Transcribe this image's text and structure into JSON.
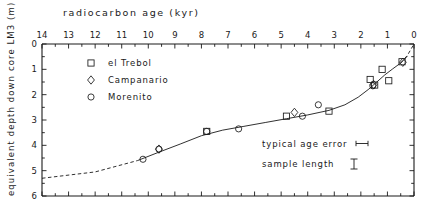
{
  "chart_data": {
    "type": "scatter",
    "title": "radiocarbon age  (kyr)",
    "xlabel": "radiocarbon age  (kyr)",
    "ylabel": "equivalent depth down core LM3  (m)",
    "xlim": [
      14,
      0
    ],
    "ylim": [
      6,
      0
    ],
    "x_axis_position": "top",
    "y_axis_inverted": true,
    "grid": false,
    "legend_position": "top-left",
    "xticks": [
      14,
      13,
      12,
      11,
      10,
      9,
      8,
      7,
      6,
      5,
      4,
      3,
      2,
      1,
      0
    ],
    "xtick_labels": [
      "14",
      "13",
      "12",
      "11",
      "10",
      "9",
      "8",
      "7",
      "6",
      "5",
      "4",
      "3",
      "2",
      "1",
      "0"
    ],
    "xminor_step": 0.5,
    "yticks": [
      0,
      1,
      2,
      3,
      4,
      5,
      6
    ],
    "ytick_labels": [
      "0",
      "1",
      "2",
      "3",
      "4",
      "5",
      "6"
    ],
    "series": [
      {
        "name": "el Trebol",
        "marker": "square",
        "points": [
          {
            "x": 7.8,
            "y": 3.45
          },
          {
            "x": 4.8,
            "y": 2.85
          },
          {
            "x": 3.2,
            "y": 2.65
          },
          {
            "x": 1.65,
            "y": 1.4
          },
          {
            "x": 1.48,
            "y": 1.62
          },
          {
            "x": 1.2,
            "y": 1.0
          },
          {
            "x": 0.95,
            "y": 1.45
          },
          {
            "x": 0.45,
            "y": 0.7
          }
        ]
      },
      {
        "name": "Campanario",
        "marker": "diamond",
        "points": [
          {
            "x": 9.6,
            "y": 4.15
          },
          {
            "x": 4.5,
            "y": 2.7
          },
          {
            "x": 1.52,
            "y": 1.6
          },
          {
            "x": 0.42,
            "y": 0.72
          }
        ]
      },
      {
        "name": "Morenito",
        "marker": "circle",
        "points": [
          {
            "x": 10.2,
            "y": 4.55
          },
          {
            "x": 9.6,
            "y": 4.15
          },
          {
            "x": 7.8,
            "y": 3.45
          },
          {
            "x": 6.6,
            "y": 3.35
          },
          {
            "x": 4.2,
            "y": 2.85
          },
          {
            "x": 3.6,
            "y": 2.4
          },
          {
            "x": 1.55,
            "y": 1.65
          }
        ]
      }
    ],
    "fit_curve": {
      "name": "age-depth model",
      "style": "solid",
      "points": [
        {
          "x": 10.4,
          "y": 4.6
        },
        {
          "x": 9.6,
          "y": 4.27
        },
        {
          "x": 8.8,
          "y": 3.95
        },
        {
          "x": 8.0,
          "y": 3.62
        },
        {
          "x": 7.2,
          "y": 3.4
        },
        {
          "x": 6.4,
          "y": 3.25
        },
        {
          "x": 5.6,
          "y": 3.1
        },
        {
          "x": 4.8,
          "y": 2.95
        },
        {
          "x": 4.0,
          "y": 2.8
        },
        {
          "x": 3.2,
          "y": 2.62
        },
        {
          "x": 2.6,
          "y": 2.4
        },
        {
          "x": 2.1,
          "y": 2.1
        },
        {
          "x": 1.7,
          "y": 1.78
        },
        {
          "x": 1.4,
          "y": 1.5
        },
        {
          "x": 1.1,
          "y": 1.22
        },
        {
          "x": 0.8,
          "y": 0.98
        },
        {
          "x": 0.5,
          "y": 0.75
        },
        {
          "x": 0.25,
          "y": 0.48
        }
      ]
    },
    "extrapolation_left": {
      "style": "dashed",
      "points": [
        {
          "x": 14.0,
          "y": 5.3
        },
        {
          "x": 12.0,
          "y": 5.05
        },
        {
          "x": 10.4,
          "y": 4.6
        }
      ]
    },
    "extrapolation_right": {
      "style": "dashed",
      "points": [
        {
          "x": 0.5,
          "y": 0.75
        },
        {
          "x": 0.25,
          "y": 0.45
        },
        {
          "x": 0.0,
          "y": 0.0
        }
      ]
    },
    "annotations": [
      {
        "label": "typical age error",
        "symbol": "horizontal-bar",
        "x": 3.0,
        "y": 3.95
      },
      {
        "label": "sample length",
        "symbol": "vertical-bar",
        "x": 2.6,
        "y": 4.45
      }
    ]
  },
  "legend": {
    "items": [
      {
        "label": "el Trebol",
        "marker": "square"
      },
      {
        "label": "Campanario",
        "marker": "diamond"
      },
      {
        "label": "Morenito",
        "marker": "circle"
      }
    ]
  },
  "axes": {
    "top_title": "radiocarbon age  (kyr)",
    "y_title": "equivalent depth down core LM3  (m)"
  },
  "annotations": {
    "age_error_label": "typical age error",
    "sample_length_label": "sample length"
  },
  "colors": {
    "ink": "#1a1a1a",
    "background": "#ffffff"
  }
}
